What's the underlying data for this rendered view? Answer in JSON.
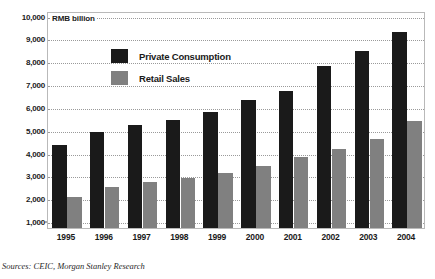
{
  "unit_label": "RMB billion",
  "source_note": "Sources: CEIC, Morgan Stanley Research",
  "legend": {
    "items": [
      {
        "label": "Private Consumption",
        "color": "#1a1a1a",
        "key": "private_consumption"
      },
      {
        "label": "Retail Sales",
        "color": "#808080",
        "key": "retail_sales"
      }
    ]
  },
  "chart_data": {
    "type": "bar",
    "title": "",
    "subtitle": "",
    "xlabel": "",
    "ylabel": "RMB billion",
    "ylim": [
      1000,
      10000
    ],
    "ytick_step": 1000,
    "grid": true,
    "legend_position": "inside-top-left",
    "categories": [
      "1995",
      "1996",
      "1997",
      "1998",
      "1999",
      "2000",
      "2001",
      "2002",
      "2003",
      "2004"
    ],
    "ytick_labels": [
      "1,000",
      "2,000",
      "3,000",
      "4,000",
      "5,000",
      "6,000",
      "7,000",
      "8,000",
      "9,000",
      "10,000"
    ],
    "ytick_values": [
      1000,
      2000,
      3000,
      4000,
      5000,
      6000,
      7000,
      8000,
      9000,
      10000
    ],
    "series": [
      {
        "name": "Private Consumption",
        "color": "#1a1a1a",
        "values": [
          4350,
          4900,
          5200,
          5450,
          5800,
          6300,
          6700,
          7800,
          8450,
          9300
        ]
      },
      {
        "name": "Retail Sales",
        "color": "#808080",
        "values": [
          2050,
          2500,
          2700,
          2900,
          3100,
          3400,
          3800,
          4150,
          4600,
          5400
        ]
      }
    ],
    "annotations": []
  }
}
